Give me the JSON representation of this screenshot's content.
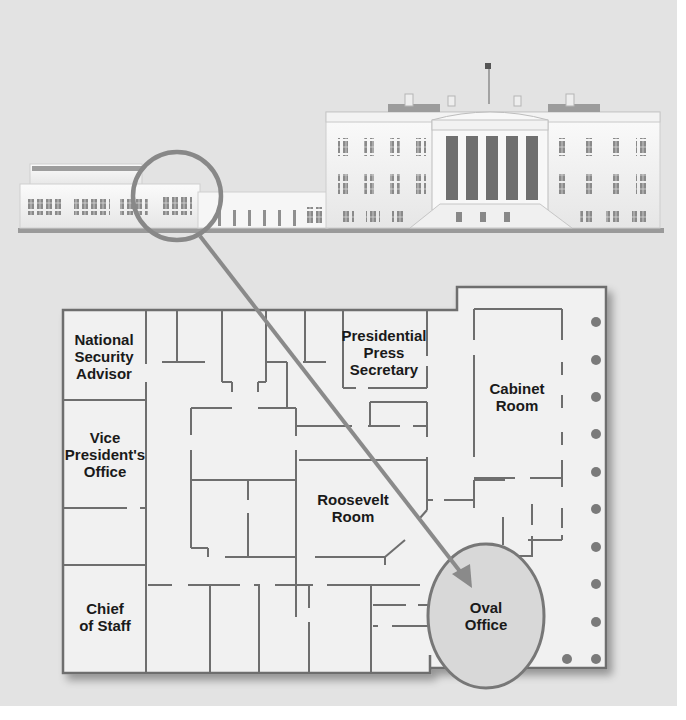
{
  "diagram": {
    "type": "floor-plan-callout",
    "colors": {
      "background": "#e3e3e3",
      "floor": "#f0f0f0",
      "wall": "#6e6e6e",
      "callout": "#7a7a7a",
      "oval_fill": "#d6d6d6",
      "column": "#7a7a7a",
      "text": "#1a1a1a"
    },
    "building": {
      "name": "White House elevation",
      "highlight": "West Wing (circled)"
    },
    "callout": {
      "description": "Magnifier circle on West Wing with arrow pointing to Oval Office"
    },
    "rooms": [
      {
        "id": "nsa",
        "lines": [
          "National",
          "Security",
          "Advisor"
        ]
      },
      {
        "id": "vp",
        "lines": [
          "Vice",
          "President's",
          "Office"
        ]
      },
      {
        "id": "cos",
        "lines": [
          "Chief",
          "of Staff"
        ]
      },
      {
        "id": "press",
        "lines": [
          "Presidential",
          "Press",
          "Secretary"
        ]
      },
      {
        "id": "cabinet",
        "lines": [
          "Cabinet",
          "Room"
        ]
      },
      {
        "id": "roosevelt",
        "lines": [
          "Roosevelt",
          "Room"
        ]
      },
      {
        "id": "oval",
        "lines": [
          "Oval",
          "Office"
        ]
      }
    ]
  }
}
